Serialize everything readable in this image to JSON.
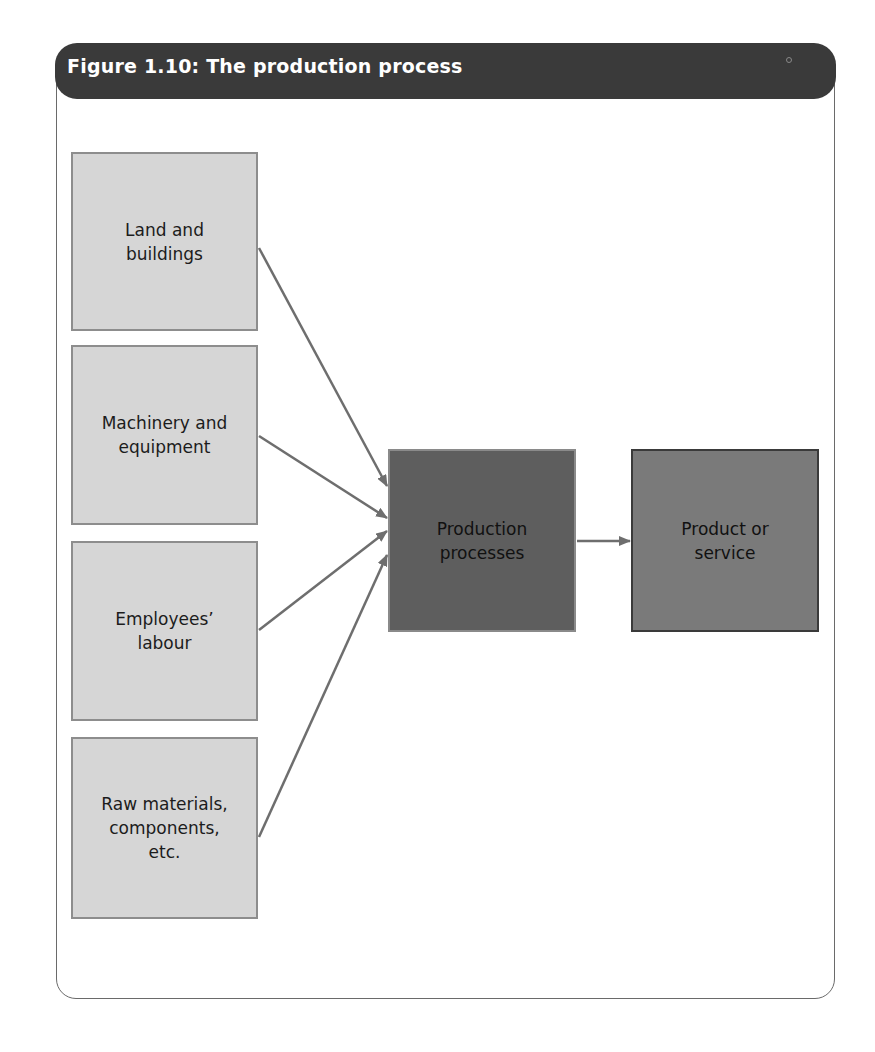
{
  "figure": {
    "title": "Figure 1.10: The production process",
    "inputs": [
      {
        "label": "Land and\nbuildings"
      },
      {
        "label": "Machinery and\nequipment"
      },
      {
        "label": "Employees’\nlabour"
      },
      {
        "label": "Raw materials,\ncomponents,\netc."
      }
    ],
    "process": {
      "label": "Production\nprocesses"
    },
    "output": {
      "label": "Product or\nservice"
    },
    "colors": {
      "header": "#3a3a3a",
      "input_fill": "#d6d6d6",
      "process_fill": "#5e5e5e",
      "output_fill": "#7a7a7a",
      "arrow": "#6e6e6e"
    }
  }
}
